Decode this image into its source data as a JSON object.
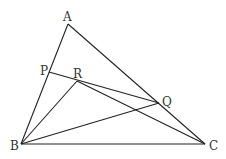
{
  "figure": {
    "type": "geometry-triangle",
    "points": {
      "A": {
        "label": "A",
        "x": 68,
        "y": 24
      },
      "B": {
        "label": "B",
        "x": 21,
        "y": 144
      },
      "C": {
        "label": "C",
        "x": 205,
        "y": 144
      },
      "P": {
        "label": "P",
        "x": 49,
        "y": 72
      },
      "R": {
        "label": "R",
        "x": 77,
        "y": 81
      },
      "Q": {
        "label": "Q",
        "x": 159,
        "y": 103
      }
    },
    "segments": [
      "AB",
      "AC",
      "BC",
      "PQ",
      "BR",
      "BQ",
      "RC"
    ],
    "stroke_color": "#222222"
  }
}
